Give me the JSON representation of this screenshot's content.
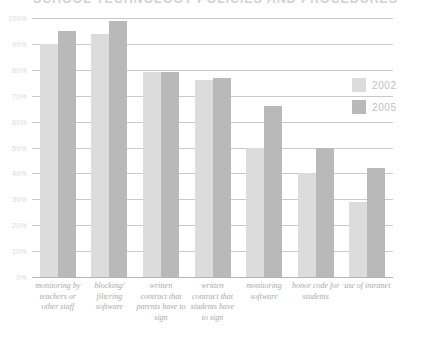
{
  "chart_data": {
    "type": "bar",
    "title": "SCHOOL TECHNOLOGY POLICIES AND PROCEDURES",
    "xlabel": "",
    "ylabel": "",
    "ylim": [
      0,
      100
    ],
    "ytick_labels": [
      "100%",
      "90%",
      "80%",
      "70%",
      "60%",
      "50%",
      "40%",
      "30%",
      "20%",
      "10%",
      "0%"
    ],
    "ytick_values": [
      100,
      90,
      80,
      70,
      60,
      50,
      40,
      30,
      20,
      10,
      0
    ],
    "grid": true,
    "legend_position": "right",
    "categories": [
      "monitoring by teachers or other staff",
      "blocking/ filtering software",
      "written contract that parents have to sign",
      "written contract that students have to sign",
      "monitoring software",
      "honor code for students",
      "use of intranet"
    ],
    "series": [
      {
        "name": "2002",
        "color": "#dcdcdc",
        "values": [
          90,
          94,
          79,
          76,
          50,
          40,
          29
        ]
      },
      {
        "name": "2005",
        "color": "#b9b9b9",
        "values": [
          95,
          99,
          79,
          77,
          66,
          50,
          42
        ]
      }
    ]
  }
}
